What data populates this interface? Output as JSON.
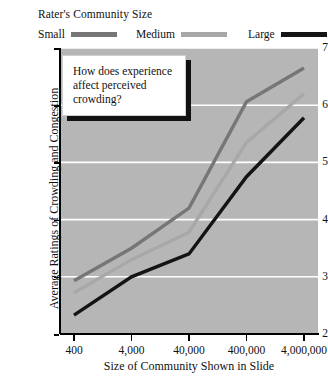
{
  "legend": {
    "title": "Rater's Community Size",
    "entries": [
      {
        "label": "Small",
        "color": "#767676"
      },
      {
        "label": "Medium",
        "color": "#a8a8a8"
      },
      {
        "label": "Large",
        "color": "#141414"
      }
    ]
  },
  "annotation": {
    "text": "How does experience affect perceived crowding?"
  },
  "axes": {
    "y_ticks": [
      "2",
      "3",
      "4",
      "5",
      "6",
      "7"
    ],
    "x_ticks": [
      "400",
      "4,000",
      "40,000",
      "400,000",
      "4,000,000"
    ],
    "xlabel": "Size of Community Shown in Slide",
    "ylabel": "Average Ratings of Crowding and Congestion"
  },
  "style": {
    "plot_background": "#b6b6b6",
    "gridline_color": "#ffffff",
    "axis_color": "#000000",
    "page_background": "#ffffff"
  },
  "chart_data": {
    "type": "line",
    "title": "",
    "subtitle": "",
    "xlabel": "Size of Community Shown in Slide",
    "ylabel": "Average Ratings of Crowding and Congestion",
    "categories": [
      "400",
      "4,000",
      "40,000",
      "400,000",
      "4,000,000"
    ],
    "series": [
      {
        "name": "Small",
        "color": "#767676",
        "values": [
          2.93,
          3.5,
          4.2,
          6.06,
          6.65
        ]
      },
      {
        "name": "Medium",
        "color": "#a8a8a8",
        "values": [
          2.72,
          3.3,
          3.78,
          5.35,
          6.2
        ]
      },
      {
        "name": "Large",
        "color": "#141414",
        "values": [
          2.33,
          3.0,
          3.4,
          4.75,
          5.78
        ]
      }
    ],
    "ylim": [
      2,
      7
    ],
    "yticks": [
      2,
      3,
      4,
      5,
      6,
      7
    ],
    "grid": "horizontal",
    "legend_position": "top",
    "legend_title": "Rater's Community Size",
    "annotations": [
      {
        "text": "How does experience affect perceived crowding?",
        "position": "top-left"
      }
    ]
  }
}
